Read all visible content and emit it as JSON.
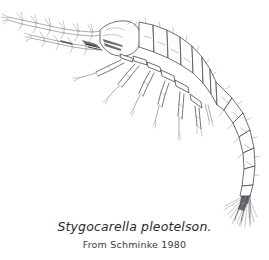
{
  "figure": {
    "kind": "scientific-line-drawing",
    "background_color": "#ffffff",
    "ink_color": "#4a4a52",
    "caption": {
      "species_label": "Stygocarella pleotelson.",
      "source_label": "From Schminke 1980"
    },
    "anatomy_labels": {
      "antenna_1": "antennule",
      "antenna_2": "antenna",
      "head": "cephalon",
      "thorax": "pereon",
      "legs": "pereopods",
      "abdomen": "pleon",
      "tail": "telson-and-uropods",
      "setae": "setae"
    }
  }
}
